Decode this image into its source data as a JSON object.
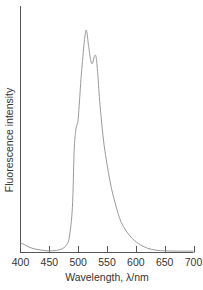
{
  "chart_data": {
    "type": "line",
    "title": "",
    "xlabel": "Wavelength, λ/nm",
    "ylabel": "Fluorescence intensity",
    "xlim": [
      400,
      700
    ],
    "ylim": [
      0,
      1
    ],
    "grid": false,
    "legend": null,
    "x_ticks": [
      400,
      450,
      500,
      550,
      600,
      650,
      700
    ],
    "x_tick_labels": [
      "400",
      "450",
      "500",
      "550",
      "600",
      "650",
      "700"
    ],
    "y_ticks": [],
    "series": [
      {
        "name": "Fluorescence emission",
        "color": "#9a9a9a",
        "x": [
          400,
          420,
          440,
          455,
          470,
          480,
          485,
          490,
          493,
          496,
          500,
          505,
          510,
          514,
          518,
          522,
          525,
          528,
          531,
          534,
          538,
          545,
          555,
          565,
          575,
          590,
          605,
          620,
          635,
          650,
          670,
          700
        ],
        "y": [
          0.04,
          0.015,
          0.005,
          0.003,
          0.01,
          0.03,
          0.07,
          0.2,
          0.45,
          0.55,
          0.6,
          0.78,
          0.93,
          1.0,
          0.93,
          0.86,
          0.85,
          0.88,
          0.88,
          0.8,
          0.66,
          0.48,
          0.32,
          0.21,
          0.13,
          0.07,
          0.035,
          0.015,
          0.006,
          0.003,
          0.002,
          0.002
        ]
      }
    ]
  },
  "axis": {
    "x_label": "Wavelength, λ/nm",
    "y_label": "Fluorescence intensity",
    "tick_labels": [
      "400",
      "450",
      "500",
      "550",
      "600",
      "650",
      "700"
    ]
  }
}
